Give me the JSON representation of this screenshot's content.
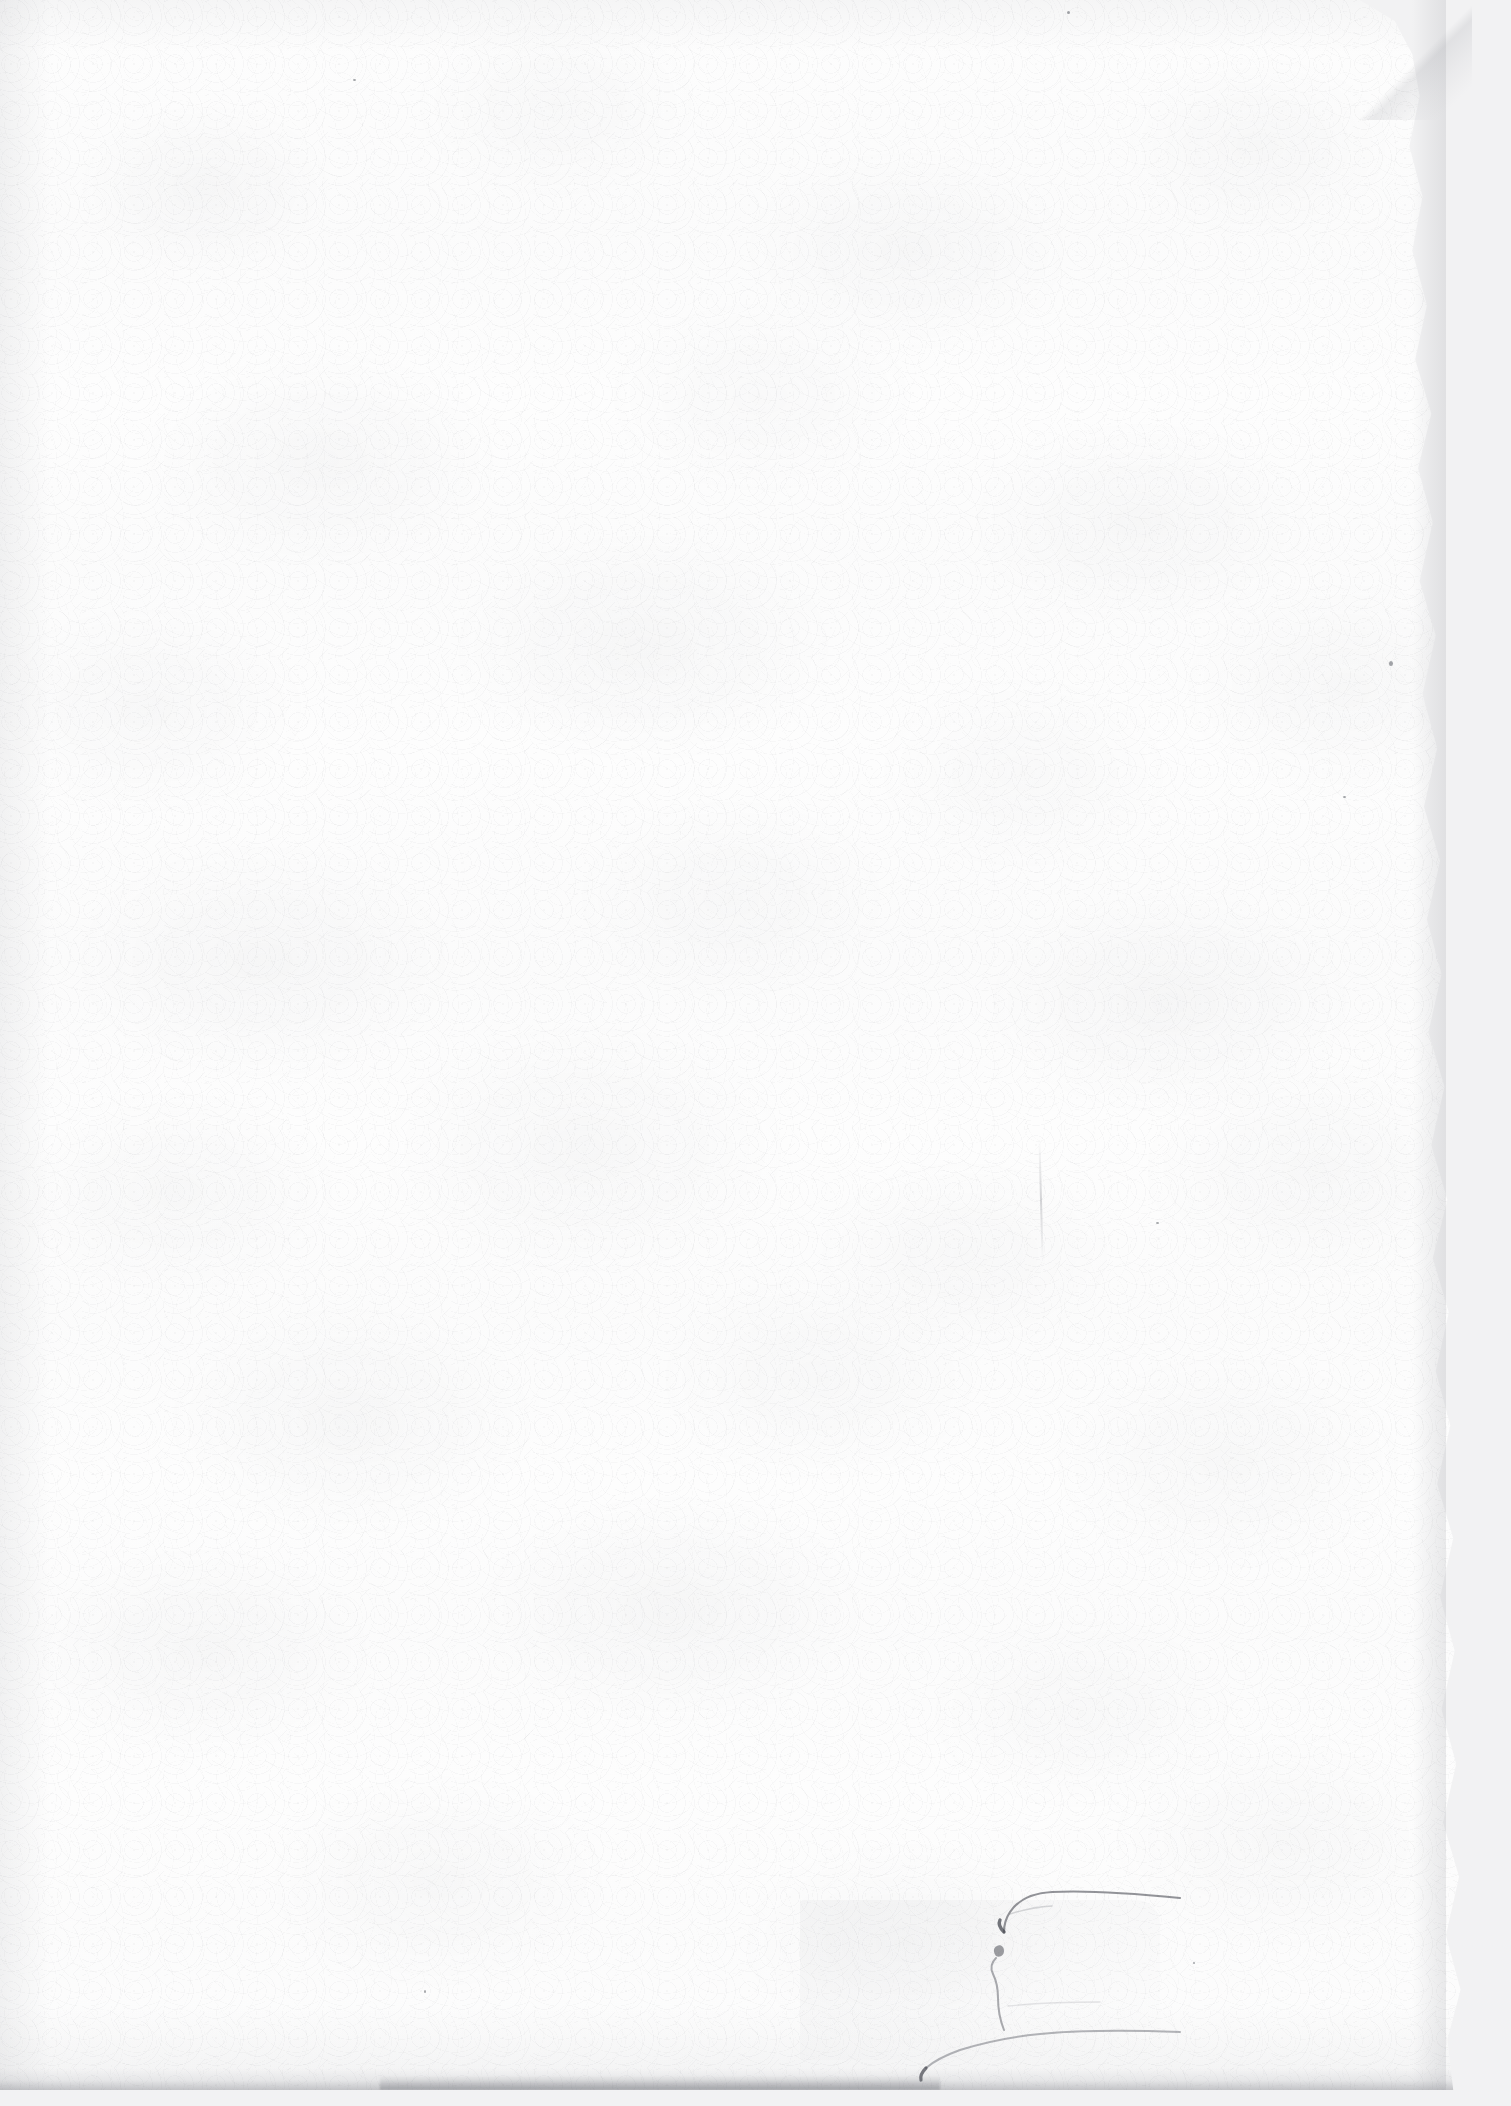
{
  "document": {
    "kind": "scanned-page",
    "title": "Blank scanned sheet",
    "orientation": "portrait",
    "page_width_px": 1511,
    "page_height_px": 2106,
    "visible_text": "",
    "text_content_present": false,
    "description": "A blank sheet of off-white paper captured on a flatbed scan. No printed or handwritten text is visible anywhere on the page."
  },
  "colors": {
    "paper": "#fdfdfd",
    "backdrop": "#f2f2f3",
    "grain": "#969aa0",
    "crease_ink": "#5a5c64",
    "edge_shadow": "#767880"
  },
  "paper": {
    "surface_label": "paper-surface",
    "texture": "mottled fibre grain",
    "tone": "off-white"
  },
  "features": [
    {
      "name": "chamfered-top-right-corner",
      "note": "Top-right corner is cut away diagonally, exposing a pale grey backdrop."
    },
    {
      "name": "deckled-right-edge",
      "note": "Right edge is irregular and slightly torn along its full height with a soft drop shadow."
    },
    {
      "name": "vertical-fold-crease",
      "note": "Short faint vertical crease near the right side, roughly mid-lower page."
    },
    {
      "name": "torn-flap-crease",
      "note": "Hook-shaped crease in the lower-right quadrant where a flap of paper has been folded or torn."
    },
    {
      "name": "bottom-edge-shadow",
      "note": "Dark grey shadow band running along the bottom edge of the sheet."
    }
  ]
}
